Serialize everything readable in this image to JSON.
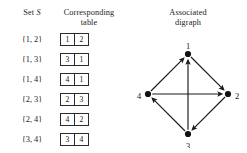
{
  "headers": {
    "set": "Set",
    "set_italic": "S",
    "table_line1": "Corresponding",
    "table_line2": "table",
    "digraph_line1": "Associated",
    "digraph_line2": "digraph"
  },
  "rows": [
    {
      "set": "{1, 2}",
      "cells": [
        "1",
        "2"
      ]
    },
    {
      "set": "{1, 3}",
      "cells": [
        "3",
        "1"
      ]
    },
    {
      "set": "{1, 4}",
      "cells": [
        "4",
        "1"
      ]
    },
    {
      "set": "{2, 3}",
      "cells": [
        "2",
        "3"
      ]
    },
    {
      "set": "{2, 4}",
      "cells": [
        "4",
        "2"
      ]
    },
    {
      "set": "{3, 4}",
      "cells": [
        "3",
        "4"
      ]
    }
  ],
  "digraph": {
    "nodes": [
      {
        "id": "1",
        "label": "1",
        "x": 54,
        "y": 14,
        "label_x": 54,
        "label_y": 7
      },
      {
        "id": "2",
        "label": "2",
        "x": 94,
        "y": 54,
        "label_x": 103,
        "label_y": 57
      },
      {
        "id": "3",
        "label": "3",
        "x": 54,
        "y": 94,
        "label_x": 54,
        "label_y": 107
      },
      {
        "id": "4",
        "label": "4",
        "x": 14,
        "y": 54,
        "label_x": 5,
        "label_y": 57
      }
    ],
    "edges": [
      {
        "from": "4",
        "to": "1"
      },
      {
        "from": "1",
        "to": "2"
      },
      {
        "from": "2",
        "to": "3"
      },
      {
        "from": "3",
        "to": "4"
      },
      {
        "from": "3",
        "to": "1"
      },
      {
        "from": "4",
        "to": "2"
      }
    ],
    "edge_color": "#1a1a1a",
    "node_color": "#111111"
  }
}
